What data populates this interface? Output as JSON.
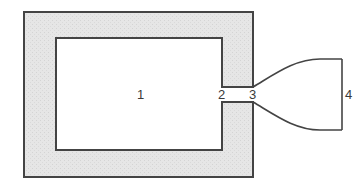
{
  "diagram": {
    "colors": {
      "wall_fill": "#e6e6e6",
      "stroke": "#444444",
      "interior": "#ffffff",
      "label": "#3a3a3a"
    },
    "labels": [
      {
        "id": "1",
        "text": "1",
        "x": 137,
        "y": 99
      },
      {
        "id": "2",
        "text": "2",
        "x": 222,
        "y": 99
      },
      {
        "id": "3",
        "text": "3",
        "x": 254,
        "y": 99
      },
      {
        "id": "4",
        "text": "4",
        "x": 345,
        "y": 99
      }
    ]
  }
}
